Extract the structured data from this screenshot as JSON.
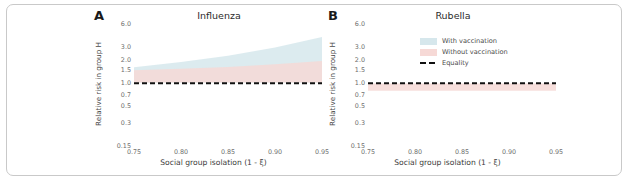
{
  "figure": {
    "background": "#ffffff",
    "border_color": "#c9c9c9"
  },
  "colors": {
    "with_vaccination": "#d6e7ec",
    "without_vaccination": "#f6d9d6",
    "equality": "#111111",
    "overlap": "#ddc8ce",
    "tick_text": "#6d6d6d",
    "axis_label": "#3a3a3a"
  },
  "legend": {
    "items": [
      {
        "label": "With vaccination",
        "type": "band",
        "color": "#d6e7ec"
      },
      {
        "label": "Without vaccination",
        "type": "band",
        "color": "#f6d9d6"
      },
      {
        "label": "Equality",
        "type": "dashed-line",
        "color": "#111111"
      }
    ]
  },
  "chart_data": [
    {
      "type": "area",
      "panel_letter": "A",
      "title": "Influenza",
      "xlabel": "Social group isolation (1 - ξ)",
      "ylabel": "Relative risk in group H",
      "yscale": "log",
      "ylim": [
        0.15,
        6.0
      ],
      "xlim": [
        0.75,
        0.95
      ],
      "grid": false,
      "yticks": [
        6.0,
        3.0,
        2.0,
        1.5,
        1.0,
        0.7,
        0.5,
        0.3,
        0.15
      ],
      "ytick_labels": [
        "6.0",
        "3.0",
        "2.0",
        "1.5",
        "1.0",
        "0.7",
        "0.5",
        "0.3",
        "0.15"
      ],
      "xticks": [
        0.75,
        0.8,
        0.85,
        0.9,
        0.95
      ],
      "xtick_labels": [
        "0.75",
        "0.80",
        "0.85",
        "0.90",
        "0.95"
      ],
      "x": [
        0.75,
        0.8,
        0.85,
        0.9,
        0.95
      ],
      "series": [
        {
          "name": "With vaccination",
          "kind": "band",
          "color": "#d6e7ec",
          "lower": [
            1.02,
            1.02,
            1.02,
            1.02,
            1.02
          ],
          "upper": [
            1.62,
            1.9,
            2.3,
            2.95,
            4.05
          ]
        },
        {
          "name": "Without vaccination",
          "kind": "band",
          "color": "#f6d9d6",
          "lower": [
            1.02,
            1.02,
            1.02,
            1.02,
            1.02
          ],
          "upper": [
            1.48,
            1.55,
            1.64,
            1.78,
            1.96
          ]
        },
        {
          "name": "Equality",
          "kind": "dashed-line",
          "color": "#111111",
          "values": [
            1.0,
            1.0,
            1.0,
            1.0,
            1.0
          ]
        }
      ]
    },
    {
      "type": "area",
      "panel_letter": "B",
      "title": "Rubella",
      "xlabel": "Social group isolation (1 - ξ)",
      "ylabel": "Relative risk in group H",
      "yscale": "log",
      "ylim": [
        0.15,
        6.0
      ],
      "xlim": [
        0.75,
        0.95
      ],
      "grid": false,
      "yticks": [
        6.0,
        3.0,
        2.0,
        1.5,
        1.0,
        0.7,
        0.5,
        0.3,
        0.15
      ],
      "ytick_labels": [
        "6.0",
        "3.0",
        "2.0",
        "1.5",
        "1.0",
        "0.7",
        "0.5",
        "0.3",
        "0.15"
      ],
      "xticks": [
        0.75,
        0.8,
        0.85,
        0.9,
        0.95
      ],
      "xtick_labels": [
        "0.75",
        "0.80",
        "0.85",
        "0.90",
        "0.95"
      ],
      "x": [
        0.75,
        0.8,
        0.85,
        0.9,
        0.95
      ],
      "series": [
        {
          "name": "With vaccination",
          "kind": "band",
          "color": "#d6e7ec",
          "lower": [
            1.0,
            1.0,
            1.0,
            1.0,
            1.0
          ],
          "upper": [
            1.0,
            1.0,
            1.0,
            1.0,
            1.0
          ]
        },
        {
          "name": "Without vaccination",
          "kind": "band",
          "color": "#f6d9d6",
          "lower": [
            0.8,
            0.8,
            0.8,
            0.8,
            0.8
          ],
          "upper": [
            0.99,
            0.99,
            0.99,
            0.99,
            0.99
          ]
        },
        {
          "name": "Equality",
          "kind": "dashed-line",
          "color": "#111111",
          "values": [
            1.0,
            1.0,
            1.0,
            1.0,
            1.0
          ]
        }
      ]
    }
  ]
}
